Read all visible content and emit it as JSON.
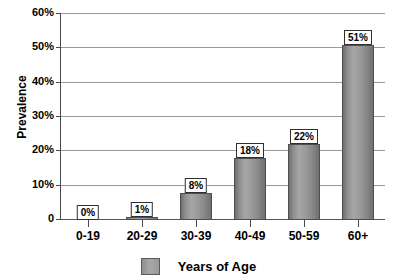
{
  "chart_data": {
    "type": "bar",
    "title": "",
    "subtitle": "",
    "xlabel": "",
    "ylabel": "Prevalence",
    "categories": [
      "0-19",
      "20-29",
      "30-39",
      "40-49",
      "50-59",
      "60+"
    ],
    "values": [
      0,
      1,
      8,
      18,
      22,
      51
    ],
    "data_labels": [
      "0%",
      "1%",
      "8%",
      "18%",
      "22%",
      "51%"
    ],
    "ylim": [
      0,
      60
    ],
    "ytick_values": [
      0,
      10,
      20,
      30,
      40,
      50,
      60
    ],
    "ytick_labels": [
      "0",
      "10%",
      "20%",
      "30%",
      "40%",
      "50%",
      "60%"
    ],
    "grid": true,
    "legend": {
      "position": "bottom",
      "entries": [
        {
          "label": "Years of Age",
          "color": "#a0a0a0"
        }
      ]
    },
    "series": [
      {
        "name": "Years of Age",
        "values": [
          0,
          1,
          8,
          18,
          22,
          51
        ],
        "color": "#9b9b9b"
      }
    ],
    "colors": {
      "bar_fill": "#9b9b9b",
      "bar_edge": "#4f4f4f",
      "gridline": "#9a9a9a",
      "axis": "#4a4a4a",
      "text": "#000000",
      "background": "#ffffff",
      "label_box_fill": "#ffffff",
      "label_box_border": "#2f2f2f"
    }
  }
}
